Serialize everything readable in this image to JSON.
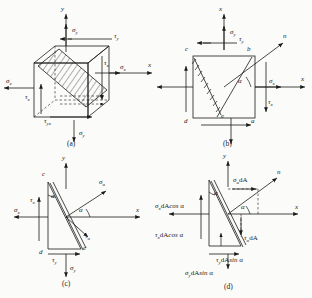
{
  "figure": {
    "captions": {
      "a": "(a)",
      "b": "(b)",
      "c": "(c)",
      "d": "(d)"
    }
  },
  "glyphs": {
    "sigma": "σ",
    "tau": "τ",
    "alpha": "α",
    "dA": "dA",
    "cos": "cos",
    "sin": "sin"
  },
  "panel_a": {
    "name": "3d-stress-cube",
    "axes": [
      {
        "name": "y-axis",
        "label": "y"
      },
      {
        "name": "x-axis",
        "label": "x"
      }
    ],
    "labels": [
      {
        "name": "sigma-y-top",
        "base": "σ",
        "sub": "y",
        "text": "σy"
      },
      {
        "name": "tau-y-top",
        "base": "τ",
        "sub": "y",
        "text": "τy"
      },
      {
        "name": "sigma-x-left",
        "base": "σ",
        "sub": "x",
        "text": "σx"
      },
      {
        "name": "sigma-x-right",
        "base": "σ",
        "sub": "x",
        "text": "σx"
      },
      {
        "name": "tau-x-right",
        "base": "τ",
        "sub": "x",
        "text": "τx"
      },
      {
        "name": "tau-x-left",
        "base": "τ",
        "sub": "x",
        "text": "τx"
      },
      {
        "name": "tau-yx-bottom",
        "base": "τ",
        "sub": "yx",
        "text": "τyx"
      },
      {
        "name": "sigma-y-bottom",
        "base": "σ",
        "sub": "y",
        "text": "σy"
      }
    ]
  },
  "panel_b": {
    "name": "2d-element-inclined-section",
    "axes": [
      {
        "name": "y-axis",
        "label": "y"
      },
      {
        "name": "x-axis",
        "label": "x"
      },
      {
        "name": "n-axis",
        "label": "n"
      }
    ],
    "corners": [
      {
        "name": "corner-c",
        "label": "c"
      },
      {
        "name": "corner-b",
        "label": "b"
      },
      {
        "name": "corner-d",
        "label": "d"
      },
      {
        "name": "corner-a",
        "label": "a"
      },
      {
        "name": "corner-e",
        "label": "e"
      }
    ],
    "angle": {
      "name": "angle-alpha",
      "label": "α"
    },
    "labels": [
      {
        "name": "sigma-y-top",
        "text": "σy"
      },
      {
        "name": "tau-y-top",
        "text": "τy"
      },
      {
        "name": "sigma-x-right",
        "text": "σx"
      },
      {
        "name": "tau-x-right",
        "text": "τx"
      }
    ]
  },
  "panel_c": {
    "name": "wedge-stress-element",
    "axes": [
      {
        "name": "y-axis",
        "label": "y"
      },
      {
        "name": "x-axis",
        "label": "x"
      }
    ],
    "corners": [
      {
        "name": "corner-c",
        "label": "c"
      },
      {
        "name": "corner-d",
        "label": "d"
      },
      {
        "name": "corner-e",
        "label": "e"
      }
    ],
    "angles": [
      {
        "name": "angle-alpha-top",
        "label": "α"
      },
      {
        "name": "angle-alpha-right",
        "label": "α"
      }
    ],
    "labels": [
      {
        "name": "sigma-x-left",
        "text": "σx"
      },
      {
        "name": "tau-x-left",
        "text": "τx"
      },
      {
        "name": "sigma-alpha",
        "text": "σα"
      },
      {
        "name": "tau-alpha",
        "text": "τα"
      },
      {
        "name": "tau-y-bottom",
        "text": "τy"
      },
      {
        "name": "sigma-y-bottom",
        "text": "σy"
      }
    ]
  },
  "panel_d": {
    "name": "wedge-force-components",
    "axes": [
      {
        "name": "y-axis",
        "label": "y"
      },
      {
        "name": "x-axis",
        "label": "x"
      },
      {
        "name": "n-axis",
        "label": "n"
      }
    ],
    "angles": [
      {
        "name": "angle-alpha-top",
        "label": "α"
      },
      {
        "name": "angle-alpha-right",
        "label": "α"
      }
    ],
    "forces": [
      {
        "name": "sigma-x-dA-cos-alpha",
        "text": "σxdAcos α"
      },
      {
        "name": "tau-x-dA-cos-alpha",
        "text": "τxdAcos α"
      },
      {
        "name": "sigma-alpha-dA",
        "text": "σαdA"
      },
      {
        "name": "tau-alpha-dA",
        "text": "ταdA"
      },
      {
        "name": "tau-y-dA-sin-alpha",
        "text": "τydAsin α"
      },
      {
        "name": "sigma-y-dA-sin-alpha",
        "text": "σydAsin α"
      }
    ]
  }
}
